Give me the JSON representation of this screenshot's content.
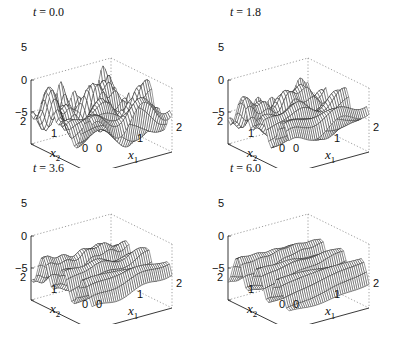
{
  "chart_data": [
    {
      "type": "surface",
      "title": "t = 0.0",
      "time": 0.0,
      "xlabel": "x1",
      "ylabel": "x2",
      "zlabel": "",
      "xlim": [
        0,
        2
      ],
      "ylim": [
        0,
        2
      ],
      "zlim": [
        -5,
        5
      ],
      "xticks": [
        "0",
        "1",
        "2"
      ],
      "yticks": [
        "0",
        "1",
        "2"
      ],
      "zticks": [
        "-5",
        "0",
        "5"
      ],
      "description": "Wireframe mesh surface with irregular peaks and valleys; amplitude roughly -5 to 5"
    },
    {
      "type": "surface",
      "title": "t = 1.8",
      "time": 1.8,
      "xlabel": "x1",
      "ylabel": "x2",
      "zlabel": "",
      "xlim": [
        0,
        2
      ],
      "ylim": [
        0,
        2
      ],
      "zlim": [
        -5,
        5
      ],
      "xticks": [
        "0",
        "1",
        "2"
      ],
      "yticks": [
        "0",
        "1",
        "2"
      ],
      "zticks": [
        "-5",
        "0",
        "5"
      ],
      "description": "Wireframe mesh surface becoming more wave-like along x2"
    },
    {
      "type": "surface",
      "title": "t = 3.6",
      "time": 3.6,
      "xlabel": "x1",
      "ylabel": "x2",
      "zlabel": "",
      "xlim": [
        0,
        2
      ],
      "ylim": [
        0,
        2
      ],
      "zlim": [
        -5,
        5
      ],
      "xticks": [
        "0",
        "1",
        "2"
      ],
      "yticks": [
        "0",
        "1",
        "2"
      ],
      "zticks": [
        "-5",
        "0",
        "5"
      ],
      "description": "Wireframe mesh surface with regular ridges along x1"
    },
    {
      "type": "surface",
      "title": "t = 6.0",
      "time": 6.0,
      "xlabel": "x1",
      "ylabel": "x2",
      "zlabel": "",
      "xlim": [
        0,
        2
      ],
      "ylim": [
        0,
        2
      ],
      "zlim": [
        -5,
        5
      ],
      "xticks": [
        "0",
        "1",
        "2"
      ],
      "yticks": [
        "0",
        "1",
        "2"
      ],
      "zticks": [
        "-5",
        "0",
        "5"
      ],
      "description": "Wireframe mesh surface with smooth plane-wave ridges"
    }
  ],
  "panels": [
    {
      "t_label": "t",
      "t_value": "= 0.0"
    },
    {
      "t_label": "t",
      "t_value": "= 1.8"
    },
    {
      "t_label": "t",
      "t_value": "= 3.6"
    },
    {
      "t_label": "t",
      "t_value": "= 6.0"
    }
  ],
  "ticks": {
    "z": [
      "5",
      "0",
      "−5"
    ],
    "x2": [
      "2",
      "1",
      "0"
    ],
    "x1": [
      "0",
      "1",
      "2"
    ]
  },
  "axis_labels": {
    "x1": "x",
    "x1_sub": "1",
    "x2": "x",
    "x2_sub": "2"
  }
}
